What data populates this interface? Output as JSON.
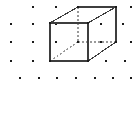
{
  "figure": {
    "width": 138,
    "height": 113,
    "background_color": "#ffffff"
  },
  "lattice": {
    "point_color": "#1a1a1a",
    "point_size": 2.6,
    "rows": [
      {
        "y": 7,
        "x": [
          33,
          56,
          78,
          101,
          116,
          131
        ]
      },
      {
        "y": 24,
        "x": [
          11,
          33,
          56,
          78,
          101,
          123
        ]
      },
      {
        "y": 42,
        "x": [
          11,
          33,
          56,
          78,
          101,
          116,
          131
        ]
      },
      {
        "y": 61,
        "x": [
          11,
          33,
          50,
          69,
          88,
          106,
          125
        ]
      },
      {
        "y": 78,
        "x": [
          20,
          39,
          57,
          76,
          95,
          113,
          131
        ]
      }
    ]
  },
  "cube": {
    "edge_color": "#3d3d3d",
    "hidden_edge_color": "#9a9a9a",
    "edge_width": 1.1,
    "hidden_edge_dash": "2,2",
    "vertices": {
      "front_top_left": {
        "x": 50,
        "y": 23
      },
      "front_top_right": {
        "x": 88,
        "y": 23
      },
      "front_bottom_left": {
        "x": 50,
        "y": 61
      },
      "front_bottom_right": {
        "x": 88,
        "y": 61
      },
      "back_top_left": {
        "x": 78,
        "y": 7
      },
      "back_top_right": {
        "x": 116,
        "y": 7
      },
      "back_bottom_left": {
        "x": 78,
        "y": 42
      },
      "back_bottom_right": {
        "x": 116,
        "y": 42
      }
    },
    "visible_edges": [
      "front_top_left-front_top_right",
      "front_top_right-front_bottom_right",
      "front_bottom_right-front_bottom_left",
      "front_bottom_left-front_top_left",
      "back_top_left-back_top_right",
      "back_top_right-back_bottom_right",
      "front_top_left-back_top_left",
      "front_top_right-back_top_right",
      "front_bottom_right-back_bottom_right"
    ],
    "hidden_edges": [
      "back_top_left-back_bottom_left",
      "back_bottom_left-back_bottom_right",
      "front_bottom_left-back_bottom_left"
    ],
    "corner_point_color": "#1a1a1a",
    "corner_point_size": 2.6
  },
  "center_point": {
    "x": 78,
    "y": 42,
    "label": "body-center lattice point"
  }
}
